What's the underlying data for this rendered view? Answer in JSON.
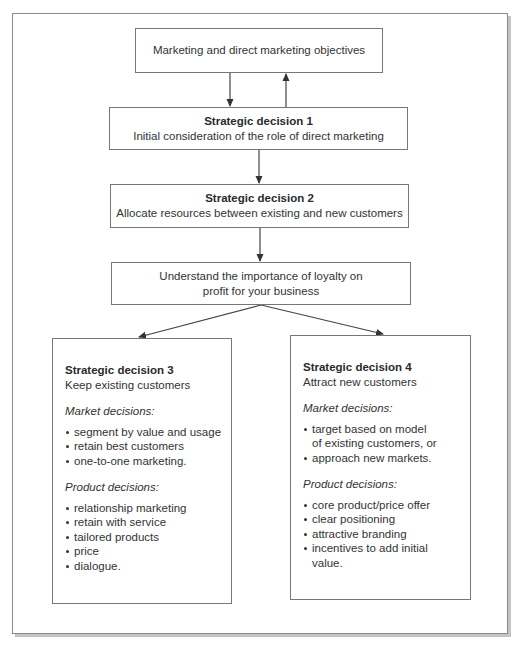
{
  "caption": "Figure",
  "colors": {
    "line": "#444444",
    "box_border": "#777777",
    "text": "#333333",
    "shadow": "#c4c4c4"
  },
  "boxes": {
    "objectives": {
      "text": "Marketing and direct marketing objectives"
    },
    "sd1": {
      "title": "Strategic decision 1",
      "subtitle": "Initial consideration of the role of direct marketing"
    },
    "sd2": {
      "title": "Strategic decision 2",
      "subtitle": "Allocate resources between existing and new customers"
    },
    "loyalty": {
      "line1": "Understand the importance of loyalty on",
      "line2": "profit for your business"
    },
    "sd3": {
      "title": "Strategic decision 3",
      "subtitle": "Keep existing customers",
      "market_label": "Market decisions:",
      "market_items": [
        "segment by value and usage",
        "retain best customers",
        "one-to-one marketing."
      ],
      "product_label": "Product decisions:",
      "product_items": [
        "relationship marketing",
        "retain with service",
        "tailored products",
        "price",
        "dialogue."
      ]
    },
    "sd4": {
      "title": "Strategic decision 4",
      "subtitle": "Attract new customers",
      "market_label": "Market decisions:",
      "market_items": [
        "target based on model",
        "of existing customers, or",
        "approach new markets."
      ],
      "product_label": "Product decisions:",
      "product_items": [
        "core product/price offer",
        "clear positioning",
        "attractive branding",
        "incentives to add initial",
        "value."
      ]
    }
  },
  "arrows": [
    {
      "from": "objectives",
      "to": "sd1",
      "direction": "down"
    },
    {
      "from": "sd1",
      "to": "objectives",
      "direction": "up"
    },
    {
      "from": "sd1",
      "to": "sd2",
      "direction": "down"
    },
    {
      "from": "sd2",
      "to": "loyalty",
      "direction": "down"
    },
    {
      "from": "loyalty",
      "to": "sd3",
      "direction": "down-left"
    },
    {
      "from": "loyalty",
      "to": "sd4",
      "direction": "down-right"
    }
  ]
}
